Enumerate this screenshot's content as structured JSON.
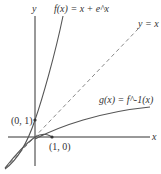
{
  "figure": {
    "axes": {
      "x_label": "x",
      "y_label": "y"
    },
    "curves": [
      {
        "id": "f",
        "label": "f(x) = x + e^x",
        "style": "solid"
      },
      {
        "id": "g",
        "label": "g(x) = f^-1(x)",
        "style": "solid"
      },
      {
        "id": "identity",
        "label": "y = x",
        "style": "dashed"
      }
    ],
    "points": [
      {
        "label": "(0, 1)"
      },
      {
        "label": "(1, 0)"
      }
    ],
    "colors": {
      "curve": "#555555",
      "axis": "#333333",
      "dashed": "#888888"
    }
  }
}
